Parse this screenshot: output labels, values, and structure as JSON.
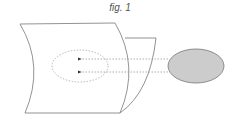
{
  "figure": {
    "caption": "fig. 1",
    "colors": {
      "sheet_stroke": "#777777",
      "dashed_stroke": "#999999",
      "arrow_fill": "#333333",
      "source_fill": "#cccccc",
      "source_stroke": "#777777"
    },
    "elements": [
      {
        "name": "front-curved-sheet",
        "type": "curved-plane"
      },
      {
        "name": "back-curved-sheet",
        "type": "curved-plane"
      },
      {
        "name": "target-region",
        "type": "dashed-ellipse"
      },
      {
        "name": "projection-arrow-1",
        "type": "dashed-arrow",
        "direction": "left"
      },
      {
        "name": "projection-arrow-2",
        "type": "dashed-arrow",
        "direction": "left"
      },
      {
        "name": "source-ellipse",
        "type": "filled-ellipse"
      }
    ]
  }
}
